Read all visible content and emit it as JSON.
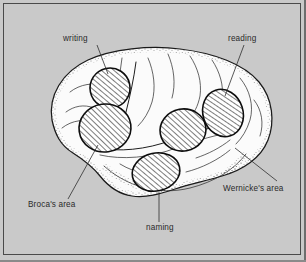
{
  "figure": {
    "background_color": "#c9c9c9",
    "frame_color": "#4a4a4a",
    "brain_fill_color": "#fbfbfb",
    "ink_color": "#1a1a1a",
    "view": "left lateral view of cerebral hemisphere"
  },
  "labels": [
    {
      "id": "writing",
      "text": "writing",
      "x": 63,
      "y": 41,
      "anchor": "start",
      "leader": "M 97 45 L 108 74"
    },
    {
      "id": "reading",
      "text": "reading",
      "x": 228,
      "y": 41,
      "anchor": "start",
      "leader": "M 244 45 L 225 96"
    },
    {
      "id": "brocas-area",
      "text": "Broca's area",
      "x": 28,
      "y": 207,
      "anchor": "start",
      "leader": "M 68 199 L 98 145"
    },
    {
      "id": "naming",
      "text": "naming",
      "x": 146,
      "y": 230,
      "anchor": "start",
      "leader": "M 159 222 L 159 192"
    },
    {
      "id": "wernickes-area",
      "text": "Wernicke's area",
      "x": 223,
      "y": 191,
      "anchor": "start",
      "leader": "M 277 181 L 235 148"
    }
  ],
  "areas": [
    {
      "id": "writing-area",
      "cx": 110,
      "cy": 88,
      "rx": 20,
      "ry": 20,
      "rotate": -12
    },
    {
      "id": "brocas-circle",
      "cx": 105,
      "cy": 128,
      "rx": 26,
      "ry": 24,
      "rotate": -8
    },
    {
      "id": "naming-area",
      "cx": 156,
      "cy": 172,
      "rx": 24,
      "ry": 19,
      "rotate": -12
    },
    {
      "id": "angular-area",
      "cx": 183,
      "cy": 130,
      "rx": 23,
      "ry": 21,
      "rotate": -10
    },
    {
      "id": "reading-area",
      "cx": 223,
      "cy": 113,
      "rx": 20,
      "ry": 24,
      "rotate": -18
    }
  ],
  "hatching": {
    "angle_degrees": -38,
    "spacing_px": 4,
    "stroke_color": "#111111"
  }
}
